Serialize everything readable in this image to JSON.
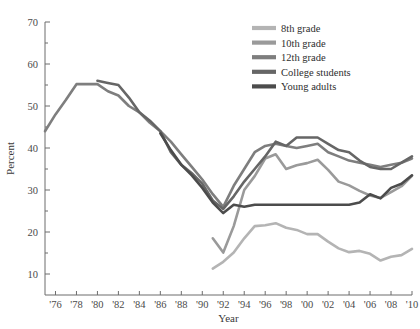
{
  "chart_data": {
    "type": "line",
    "title": "",
    "xlabel": "Year",
    "ylabel": "Percent",
    "xlim": [
      1975,
      2010
    ],
    "ylim": [
      5,
      70
    ],
    "grid": false,
    "legend_position": "top-right",
    "x_tick_labels": [
      "'76",
      "'78",
      "'80",
      "'82",
      "'84",
      "'86",
      "'88",
      "'90",
      "'92",
      "'94",
      "'96",
      "'98",
      "'00",
      "'02",
      "'04",
      "'06",
      "'08",
      "'10"
    ],
    "x_tick_values": [
      1976,
      1978,
      1980,
      1982,
      1984,
      1986,
      1988,
      1990,
      1992,
      1994,
      1996,
      1998,
      2000,
      2002,
      2004,
      2006,
      2008,
      2010
    ],
    "y_tick_labels": [
      "10",
      "20",
      "30",
      "40",
      "50",
      "60",
      "70"
    ],
    "y_tick_values": [
      10,
      20,
      30,
      40,
      50,
      60,
      70
    ],
    "y_minor_ticks": [
      15,
      25,
      35,
      45,
      55,
      65
    ],
    "series": [
      {
        "name": "8th grade",
        "color": "#b4b4b4",
        "x": [
          1991,
          1992,
          1993,
          1994,
          1995,
          1996,
          1997,
          1998,
          1999,
          2000,
          2001,
          2002,
          2003,
          2004,
          2005,
          2006,
          2007,
          2008,
          2009,
          2010
        ],
        "values": [
          11.3,
          12.9,
          15.1,
          18.5,
          21.4,
          21.6,
          22.1,
          21.0,
          20.5,
          19.5,
          19.5,
          17.7,
          16.1,
          15.2,
          15.5,
          14.8,
          13.2,
          14.1,
          14.5,
          16.0
        ]
      },
      {
        "name": "10th grade",
        "color": "#9a9a9a",
        "x": [
          1991,
          1992,
          1993,
          1994,
          1995,
          1996,
          1997,
          1998,
          1999,
          2000,
          2001,
          2002,
          2003,
          2004,
          2005,
          2006,
          2007,
          2008,
          2009,
          2010
        ],
        "values": [
          18.5,
          15.1,
          21.4,
          30.0,
          33.3,
          37.5,
          38.5,
          35.0,
          35.9,
          36.4,
          37.2,
          34.8,
          32.0,
          31.1,
          29.8,
          28.7,
          28.1,
          29.5,
          30.9,
          33.4
        ]
      },
      {
        "name": "12th grade",
        "color": "#7e7e7e",
        "x": [
          1975,
          1976,
          1977,
          1978,
          1979,
          1980,
          1981,
          1982,
          1983,
          1984,
          1985,
          1986,
          1987,
          1988,
          1989,
          1990,
          1991,
          1992,
          1993,
          1994,
          1995,
          1996,
          1997,
          1998,
          1999,
          2000,
          2001,
          2002,
          2003,
          2004,
          2005,
          2006,
          2007,
          2008,
          2009,
          2010
        ],
        "values": [
          44.0,
          48.0,
          51.5,
          55.2,
          55.2,
          55.2,
          53.5,
          52.5,
          50.0,
          48.5,
          46.0,
          44.0,
          41.5,
          38.5,
          35.5,
          32.5,
          29.0,
          26.0,
          31.0,
          35.0,
          39.0,
          40.5,
          41.0,
          40.5,
          40.0,
          40.5,
          41.0,
          39.0,
          38.0,
          37.0,
          36.5,
          36.0,
          35.5,
          36.0,
          36.5,
          37.5
        ]
      },
      {
        "name": "College students",
        "color": "#666666",
        "x": [
          1980,
          1981,
          1982,
          1983,
          1984,
          1985,
          1986,
          1987,
          1988,
          1989,
          1990,
          1991,
          1992,
          1993,
          1994,
          1995,
          1996,
          1997,
          1998,
          1999,
          2000,
          2001,
          2002,
          2003,
          2004,
          2005,
          2006,
          2007,
          2008,
          2009,
          2010
        ],
        "values": [
          56.0,
          55.5,
          55.0,
          52.0,
          48.5,
          46.5,
          44.0,
          39.0,
          36.0,
          34.0,
          31.5,
          27.5,
          25.5,
          28.5,
          32.0,
          35.0,
          38.0,
          41.5,
          40.5,
          42.5,
          42.5,
          42.5,
          41.0,
          39.5,
          39.0,
          37.0,
          35.5,
          35.0,
          35.0,
          36.5,
          38.0
        ]
      },
      {
        "name": "Young adults",
        "color": "#4c4c4c",
        "x": [
          1986,
          1987,
          1988,
          1989,
          1990,
          1991,
          1992,
          1993,
          1994,
          1995,
          1996,
          1997,
          1998,
          1999,
          2000,
          2001,
          2002,
          2003,
          2004,
          2005,
          2006,
          2007,
          2008,
          2009,
          2010
        ],
        "values": [
          43.5,
          39.5,
          36.0,
          33.5,
          30.5,
          27.0,
          24.5,
          26.5,
          26.0,
          26.5,
          26.5,
          26.5,
          26.5,
          26.5,
          26.5,
          26.5,
          26.5,
          26.5,
          26.5,
          27.0,
          29.0,
          28.0,
          30.5,
          31.5,
          33.5
        ]
      }
    ]
  },
  "legend": {
    "items": [
      {
        "label": "8th grade"
      },
      {
        "label": "10th grade"
      },
      {
        "label": "12th grade"
      },
      {
        "label": "College students"
      },
      {
        "label": "Young adults"
      }
    ]
  }
}
